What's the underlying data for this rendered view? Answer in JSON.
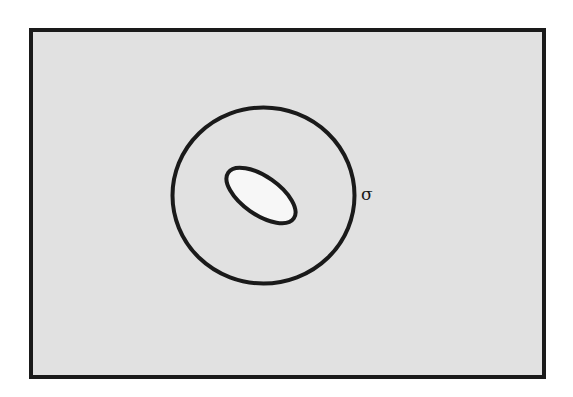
{
  "diagram": {
    "colors": {
      "background": "#ffffff",
      "region_fill": "#e1e1e1",
      "stroke": "#1a1a1a",
      "inner_fill": "#f7f7f7"
    },
    "frame": {
      "x": 31,
      "y": 30,
      "width": 513,
      "height": 347,
      "stroke_width": 4
    },
    "circle": {
      "cx": 263.5,
      "cy": 195.5,
      "rx": 91,
      "ry": 88,
      "stroke_width": 4
    },
    "inner_ellipse": {
      "cx": 261,
      "cy": 195.5,
      "rx": 40,
      "ry": 19,
      "rotation_deg": 35,
      "stroke_width": 4
    },
    "labels": {
      "circle_label": "σ"
    },
    "label_position": {
      "x": 361,
      "y": 200
    }
  }
}
